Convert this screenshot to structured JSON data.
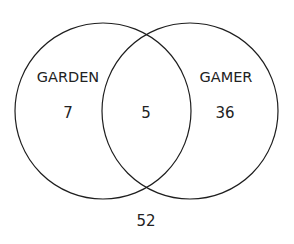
{
  "diagram": {
    "type": "venn",
    "sets": [
      {
        "label": "GARDEN",
        "only_count": "7",
        "cx": 103,
        "cy": 111,
        "r": 88
      },
      {
        "label": "GAMER",
        "only_count": "36",
        "cx": 190,
        "cy": 111,
        "r": 88
      }
    ],
    "intersection_count": "5",
    "outside_count": "52",
    "stroke_color": "#1e1e1e",
    "text_color": "#222222",
    "background": "#ffffff"
  }
}
